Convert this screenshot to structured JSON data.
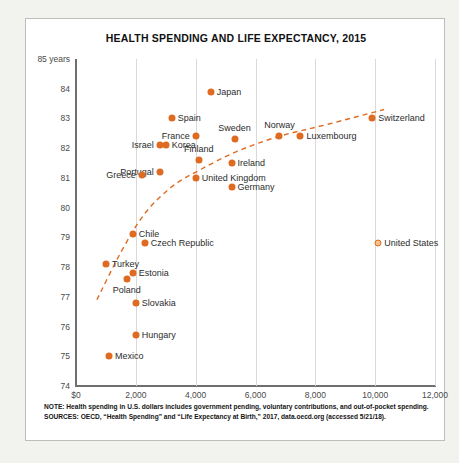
{
  "chart_data": {
    "type": "scatter",
    "title": "HEALTH SPENDING AND LIFE EXPECTANCY, 2015",
    "xlabel": "",
    "ylabel": "",
    "ylim": [
      74,
      85
    ],
    "xlim": [
      0,
      12000
    ],
    "grid": "vertical",
    "legend": "none",
    "y_axis_unit_label": "85 years",
    "yticks": [
      {
        "value": 85,
        "label": "85 years"
      },
      {
        "value": 84,
        "label": "84"
      },
      {
        "value": 83,
        "label": "83"
      },
      {
        "value": 82,
        "label": "82"
      },
      {
        "value": 81,
        "label": "81"
      },
      {
        "value": 80,
        "label": "80"
      },
      {
        "value": 79,
        "label": "79"
      },
      {
        "value": 78,
        "label": "78"
      },
      {
        "value": 77,
        "label": "77"
      },
      {
        "value": 76,
        "label": "76"
      },
      {
        "value": 75,
        "label": "75"
      },
      {
        "value": 74,
        "label": "74"
      }
    ],
    "xticks": [
      {
        "value": 0,
        "label": "$0"
      },
      {
        "value": 2000,
        "label": "2,000"
      },
      {
        "value": 4000,
        "label": "4,000"
      },
      {
        "value": 6000,
        "label": "6,000"
      },
      {
        "value": 8000,
        "label": "8,000"
      },
      {
        "value": 10000,
        "label": "10,000"
      },
      {
        "value": 12000,
        "label": "12,000"
      }
    ],
    "points": [
      {
        "name": "Japan",
        "x": 4500,
        "y": 83.9,
        "label_side": "right",
        "marker": "filled"
      },
      {
        "name": "Spain",
        "x": 3200,
        "y": 83.0,
        "label_side": "right",
        "marker": "filled"
      },
      {
        "name": "Switzerland",
        "x": 9900,
        "y": 83.0,
        "label_side": "right",
        "marker": "filled"
      },
      {
        "name": "France",
        "x": 4000,
        "y": 82.4,
        "label_side": "left",
        "marker": "filled"
      },
      {
        "name": "Norway",
        "x": 6800,
        "y": 82.4,
        "label_side": "above",
        "marker": "filled"
      },
      {
        "name": "Sweden",
        "x": 5300,
        "y": 82.3,
        "label_side": "above",
        "marker": "filled"
      },
      {
        "name": "Luxembourg",
        "x": 7500,
        "y": 82.4,
        "label_side": "right",
        "marker": "filled"
      },
      {
        "name": "Israel",
        "x": 2800,
        "y": 82.1,
        "label_side": "left",
        "marker": "filled"
      },
      {
        "name": "Korea",
        "x": 3000,
        "y": 82.1,
        "label_side": "right",
        "marker": "filled"
      },
      {
        "name": "Finland",
        "x": 4100,
        "y": 81.6,
        "label_side": "above",
        "marker": "filled"
      },
      {
        "name": "Portugal",
        "x": 2800,
        "y": 81.2,
        "label_side": "left",
        "marker": "filled"
      },
      {
        "name": "Greece",
        "x": 2200,
        "y": 81.1,
        "label_side": "left",
        "marker": "filled"
      },
      {
        "name": "Ireland",
        "x": 5200,
        "y": 81.5,
        "label_side": "right",
        "marker": "filled"
      },
      {
        "name": "United Kingdom",
        "x": 4000,
        "y": 81.0,
        "label_side": "right",
        "marker": "filled"
      },
      {
        "name": "Germany",
        "x": 5200,
        "y": 80.7,
        "label_side": "right",
        "marker": "filled"
      },
      {
        "name": "Chile",
        "x": 1900,
        "y": 79.1,
        "label_side": "right",
        "marker": "filled"
      },
      {
        "name": "Czech Republic",
        "x": 2300,
        "y": 78.8,
        "label_side": "right",
        "marker": "filled"
      },
      {
        "name": "Turkey",
        "x": 1000,
        "y": 78.1,
        "label_side": "right",
        "marker": "filled"
      },
      {
        "name": "Estonia",
        "x": 1900,
        "y": 77.8,
        "label_side": "right",
        "marker": "filled"
      },
      {
        "name": "Poland",
        "x": 1700,
        "y": 77.6,
        "label_side": "below",
        "marker": "filled"
      },
      {
        "name": "Slovakia",
        "x": 2000,
        "y": 76.8,
        "label_side": "right",
        "marker": "filled"
      },
      {
        "name": "Hungary",
        "x": 2000,
        "y": 75.7,
        "label_side": "right",
        "marker": "filled"
      },
      {
        "name": "Mexico",
        "x": 1100,
        "y": 75.0,
        "label_side": "right",
        "marker": "filled"
      },
      {
        "name": "United States",
        "x": 10100,
        "y": 78.8,
        "label_side": "right",
        "marker": "hollow"
      }
    ],
    "trendline": {
      "style": "dashed",
      "color": "#de6b21",
      "points": [
        {
          "x": 700,
          "y": 76.9
        },
        {
          "x": 1500,
          "y": 78.5
        },
        {
          "x": 2300,
          "y": 79.8
        },
        {
          "x": 3200,
          "y": 80.7
        },
        {
          "x": 4200,
          "y": 81.3
        },
        {
          "x": 5400,
          "y": 81.9
        },
        {
          "x": 6800,
          "y": 82.4
        },
        {
          "x": 8400,
          "y": 82.8
        },
        {
          "x": 10300,
          "y": 83.3
        }
      ]
    }
  },
  "colors": {
    "accent": "#de6b21",
    "accent_hollow_fill": "#f3c48a",
    "axis": "#6f6f6f",
    "grid": "#d9d9d9",
    "page_background": "#f2f2ef",
    "card_background": "#ffffff"
  },
  "notes": {
    "note_line": "NOTE: Health spending in U.S. dollars includes government pending, voluntary contributions, and out-of-pocket spending.",
    "sources_line": "SOURCES: OECD, “Health Spending” and “Life Expectancy at Birth,” 2017, data.oecd.org (accessed 5/21/18)."
  }
}
